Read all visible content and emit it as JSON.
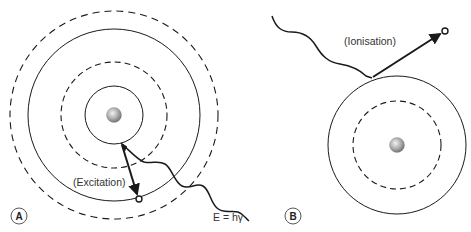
{
  "panels": [
    {
      "id": "A",
      "badge": "A",
      "label": "(Excitation)",
      "energy_label": "E = hγ",
      "shells": [
        "solid",
        "dashed",
        "solid",
        "dashed"
      ]
    },
    {
      "id": "B",
      "badge": "B",
      "label": "(Ionisation)",
      "shells": [
        "dashed",
        "solid"
      ]
    }
  ],
  "colors": {
    "line": "#1a1a1a",
    "nucleus_light": "#e8e8e8",
    "nucleus_dark": "#7a7a7a",
    "text": "#333333"
  }
}
